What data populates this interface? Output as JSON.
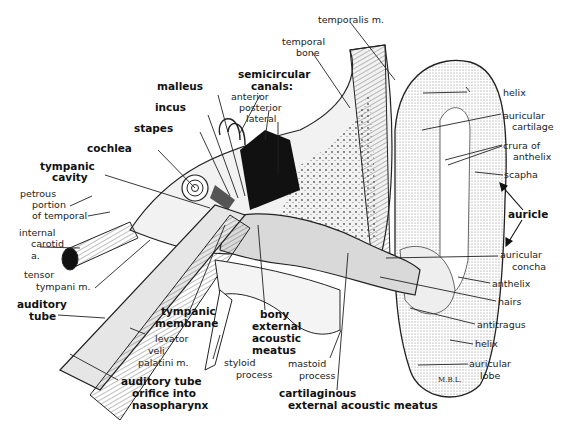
{
  "diagram": {
    "artist_signature": "M.B.L."
  },
  "labels": {
    "temporalis_m": "temporalis m.",
    "temporal_bone_1": "temporal",
    "temporal_bone_2": "bone",
    "semicircular_1": "semicircular",
    "semicircular_2": "canals:",
    "anterior": "anterior",
    "posterior": "posterior",
    "lateral": "lateral",
    "malleus": "malleus",
    "incus": "incus",
    "stapes": "stapes",
    "cochlea": "cochlea",
    "tympanic_cavity_1": "tympanic",
    "tympanic_cavity_2": "cavity",
    "petrous_1": "petrous",
    "petrous_2": "portion",
    "petrous_3": "of temporal",
    "internal_carotid_1": "internal",
    "internal_carotid_2": "carotid",
    "internal_carotid_3": "a.",
    "tensor_1": "tensor",
    "tensor_2": "tympani m.",
    "auditory_tube_1": "auditory",
    "auditory_tube_2": "tube",
    "tympanic_membrane_1": "tympanic",
    "tympanic_membrane_2": "membrane",
    "levator_1": "levator",
    "levator_2": "veli",
    "levator_3": "palatini m.",
    "orifice_1": "auditory tube",
    "orifice_2": "orifice into",
    "orifice_3": "nasopharynx",
    "styloid_1": "styloid",
    "styloid_2": "process",
    "bony_1": "bony",
    "bony_2": "external",
    "bony_3": "acoustic",
    "bony_4": "meatus",
    "mastoid_1": "mastoid",
    "mastoid_2": "process",
    "cartilaginous_1": "cartilaginous",
    "cartilaginous_2": "external acoustic meatus",
    "helix_top": "helix",
    "auricular_cartilage_1": "auricular",
    "auricular_cartilage_2": "cartilage",
    "crura_1": "crura of",
    "crura_2": "anthelix",
    "scapha": "scapha",
    "auricle": "auricle",
    "concha_1": "auricular",
    "concha_2": "concha",
    "anthelix": "anthelix",
    "hairs": "hairs",
    "antitragus": "antitragus",
    "helix_bottom": "helix",
    "lobe_1": "auricular",
    "lobe_2": "lobe"
  },
  "colors": {
    "ink": "#1a1a1a",
    "background": "#ffffff",
    "shade": "#d9d9d9"
  }
}
